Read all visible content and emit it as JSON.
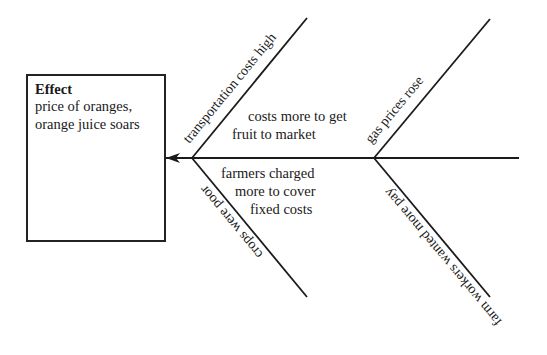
{
  "effect": {
    "title": "Effect",
    "line1": "price of oranges,",
    "line2": "orange juice soars"
  },
  "causes": {
    "upper_left": "transportation costs high",
    "lower_left": "crops were poor",
    "upper_right": "gas prices rose",
    "lower_right": "farm workers wanted more pay"
  },
  "notes": {
    "upper": {
      "line1": "costs more to get",
      "line2": "fruit to market"
    },
    "lower": {
      "line1": "farmers charged",
      "line2": "more to cover",
      "line3": "fixed costs"
    }
  },
  "colors": {
    "line": "#1a1a1a",
    "background": "#ffffff"
  }
}
